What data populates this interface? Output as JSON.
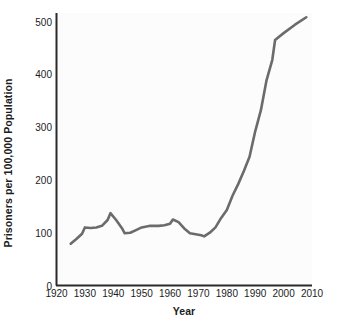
{
  "chart_data": {
    "type": "line",
    "title": "",
    "xlabel": "Year",
    "ylabel": "Prisoners per 100,000 Population",
    "xlim": [
      1920,
      2010
    ],
    "ylim": [
      0,
      500
    ],
    "xticks": [
      "1920",
      "1930",
      "1940",
      "1950",
      "1960",
      "1970",
      "1980",
      "1990",
      "2000",
      "2010"
    ],
    "yticks": [
      "0",
      "100",
      "200",
      "300",
      "400",
      "500"
    ],
    "grid": false,
    "legend": false,
    "line_color": "#6b6b6b",
    "series": [
      {
        "name": "Prisoners per 100,000 Population",
        "x": [
          1925,
          1927,
          1929,
          1930,
          1932,
          1934,
          1936,
          1938,
          1939,
          1941,
          1943,
          1944,
          1946,
          1948,
          1950,
          1953,
          1956,
          1958,
          1960,
          1961,
          1963,
          1965,
          1967,
          1969,
          1971,
          1972,
          1974,
          1976,
          1978,
          1980,
          1982,
          1984,
          1986,
          1988,
          1990,
          1992,
          1994,
          1996,
          1997,
          2000,
          2004,
          2008
        ],
        "values": [
          79,
          88,
          98,
          110,
          109,
          110,
          113,
          124,
          137,
          124,
          109,
          99,
          100,
          105,
          110,
          113,
          113,
          114,
          117,
          125,
          120,
          108,
          99,
          97,
          95,
          93,
          100,
          110,
          128,
          143,
          170,
          192,
          217,
          244,
          292,
          332,
          389,
          427,
          465,
          478,
          494,
          508
        ]
      }
    ]
  }
}
